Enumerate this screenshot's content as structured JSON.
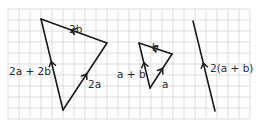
{
  "diagram": {
    "type": "vector-diagram-on-grid",
    "grid": {
      "x0": 8,
      "y0": 9,
      "cell": 11,
      "cols": 22,
      "rows": 10,
      "color": "#d4d4d4"
    },
    "line_color": "#1a1a1a",
    "figures": [
      {
        "name": "large-triangle",
        "vectors": [
          {
            "id": "2a",
            "label": "2a",
            "from": [
              63,
              110
            ],
            "to": [
              107,
              43
            ],
            "label_pos": [
              88,
              80
            ]
          },
          {
            "id": "2b",
            "label": "2b",
            "from": [
              107,
              43
            ],
            "to": [
              41,
              19
            ],
            "label_pos": [
              69,
              25
            ]
          },
          {
            "id": "2a+2b",
            "label": "2a + 2b",
            "from": [
              63,
              110
            ],
            "to": [
              41,
              19
            ],
            "label_pos": [
              9,
              67
            ]
          }
        ]
      },
      {
        "name": "small-triangle",
        "vectors": [
          {
            "id": "a",
            "label": "a",
            "from": [
              150,
              88
            ],
            "to": [
              172,
              54
            ],
            "label_pos": [
              162,
              80
            ]
          },
          {
            "id": "b",
            "label": "b",
            "from": [
              172,
              54
            ],
            "to": [
              139,
              43
            ],
            "label_pos": [
              152,
              43
            ]
          },
          {
            "id": "a+b",
            "label": "a + b",
            "from": [
              150,
              88
            ],
            "to": [
              139,
              43
            ],
            "label_pos": [
              117,
              70
            ]
          }
        ]
      },
      {
        "name": "single-vector",
        "vectors": [
          {
            "id": "2(a+b)",
            "label": "2(a + b)",
            "from": [
              215,
              111
            ],
            "to": [
              193,
              21
            ],
            "label_pos": [
              210,
              64
            ]
          }
        ]
      }
    ]
  }
}
